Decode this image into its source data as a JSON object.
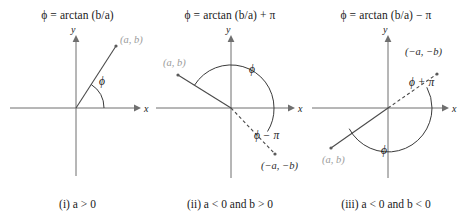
{
  "figure": {
    "kind": "phase-angle-arctan-quadrant-diagram",
    "panel_count": 3,
    "background_color": "#ffffff",
    "gray_accent_color": "#9b9b9b",
    "axis_color": "#6f6f6f"
  },
  "panels": [
    {
      "id": "panel-1",
      "title": "ϕ = arctan (b/a)",
      "caption": "(i) a > 0",
      "axis_x_label": "x",
      "axis_y_label": "y",
      "point_label": "(a, b)",
      "angle_labels": [
        "ϕ"
      ],
      "ray_description": "solid ray into first quadrant toward (a, b)",
      "arc_description": "single arc from positive x-axis counterclockwise to the ray"
    },
    {
      "id": "panel-2",
      "title": "ϕ = arctan (b/a) + π",
      "caption": "(ii) a < 0 and b > 0",
      "axis_x_label": "x",
      "axis_y_label": "y",
      "point_label_primary": "(a, b)",
      "point_label_secondary": "(−a, −b)",
      "angle_labels": [
        "ϕ",
        "ϕ − π"
      ],
      "ray_description": "solid ray into second quadrant toward (a, b); dashed ray into fourth quadrant toward (-a, -b)",
      "arc_description": "large arc from positive x-axis counterclockwise to the solid ray; small arc from positive x-axis clockwise to the dashed ray"
    },
    {
      "id": "panel-3",
      "title": "ϕ = arctan (b/a) − π",
      "caption": "(iii) a < 0 and b < 0",
      "axis_x_label": "x",
      "axis_y_label": "y",
      "point_label_primary": "(a, b)",
      "point_label_secondary": "(−a, −b)",
      "angle_labels": [
        "ϕ + π",
        "ϕ"
      ],
      "ray_description": "solid ray into third quadrant toward (a, b); dashed ray into first quadrant toward (-a, -b)",
      "arc_description": "large arc from positive x-axis clockwise to the solid ray; small arc from positive x-axis counterclockwise to the dashed ray"
    }
  ]
}
